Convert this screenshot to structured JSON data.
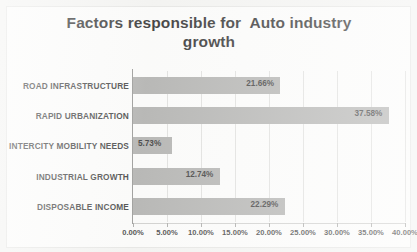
{
  "chart_data": {
    "type": "bar",
    "orientation": "horizontal",
    "title": "Factors responsible for  Auto industry\ngrowth",
    "title_line1": "Factors responsible for  Auto industry",
    "title_line2": "growth",
    "xlabel": "",
    "ylabel": "",
    "categories": [
      "ROAD INFRASTRUCTURE",
      "RAPID URBANIZATION",
      "INTERCITY MOBILITY NEEDS",
      "INDUSTRIAL GROWTH",
      "DISPOSABLE INCOME"
    ],
    "values": [
      21.66,
      37.58,
      5.73,
      12.74,
      22.29
    ],
    "data_labels": [
      "21.66%",
      "37.58%",
      "5.73%",
      "12.74%",
      "22.29%"
    ],
    "xlim": [
      0,
      40
    ],
    "xticks": [
      0,
      5,
      10,
      15,
      20,
      25,
      30,
      35,
      40
    ],
    "xtick_labels": [
      "0.00%",
      "5.00%",
      "10.00%",
      "15.00%",
      "20.00%",
      "25.00%",
      "30.00%",
      "35.00%",
      "40.00%"
    ],
    "grid": true,
    "grid_axis": "x",
    "legend": false,
    "bar_color": "#a9a9a7",
    "plot_background": "#fbfbfa",
    "frame_background": "#f2f2f0",
    "text_color": "#2b2b2b"
  }
}
